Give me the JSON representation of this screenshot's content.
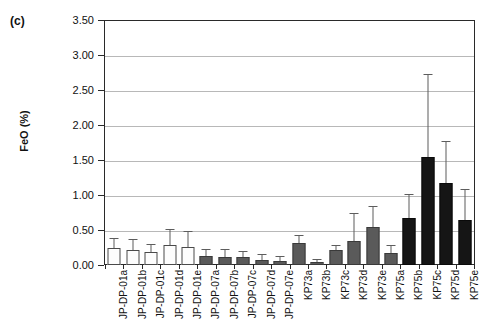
{
  "panel": {
    "label": "(c)"
  },
  "chart_data": {
    "type": "bar",
    "title": "",
    "subtitle": "",
    "xlabel": "",
    "ylabel": "FeO (%)",
    "ylim": [
      0.0,
      3.5
    ],
    "ytick_labels": [
      "0.00",
      "0.50",
      "1.00",
      "1.50",
      "2.00",
      "2.50",
      "3.00",
      "3.50"
    ],
    "ytick_values": [
      0.0,
      0.5,
      1.0,
      1.5,
      2.0,
      2.5,
      3.0,
      3.5
    ],
    "grid": "horizontal",
    "legend": "none",
    "categories": [
      "JP-DP-01a",
      "JP-DP-01b",
      "JP-DP-01c",
      "JP-DP-01d",
      "JP-DP-01e",
      "JP-DP-07a",
      "JP-DP-07b",
      "JP-DP-07c",
      "JP-DP-07d",
      "JP-DP-07e",
      "KP73a",
      "KP73b",
      "KP73c",
      "KP73d",
      "KP73e",
      "KP75a",
      "KP75b",
      "KP75c",
      "KP75d",
      "KP75e"
    ],
    "values": [
      0.25,
      0.22,
      0.18,
      0.29,
      0.26,
      0.13,
      0.12,
      0.11,
      0.07,
      0.06,
      0.32,
      0.04,
      0.21,
      0.35,
      0.55,
      0.17,
      0.68,
      1.55,
      1.17,
      0.65
    ],
    "errors_upper": [
      0.38,
      0.36,
      0.28,
      0.5,
      0.48,
      0.22,
      0.21,
      0.19,
      0.14,
      0.12,
      0.42,
      0.07,
      0.27,
      0.73,
      0.83,
      0.27,
      1.0,
      2.73,
      1.77,
      1.07
    ],
    "bar_styles": [
      "light",
      "light",
      "light",
      "light",
      "light",
      "mid",
      "mid",
      "mid",
      "mid",
      "mid",
      "mid",
      "mid",
      "mid",
      "mid",
      "mid",
      "mid",
      "dark",
      "dark",
      "dark",
      "dark"
    ],
    "colors": {
      "light_fill": "#fdfdfd",
      "mid_fill": "#5a5a5a",
      "dark_fill": "#151515",
      "grid": "#b8b8b8",
      "axis": "#2a2a2a",
      "error": "#5d5d5d"
    }
  }
}
